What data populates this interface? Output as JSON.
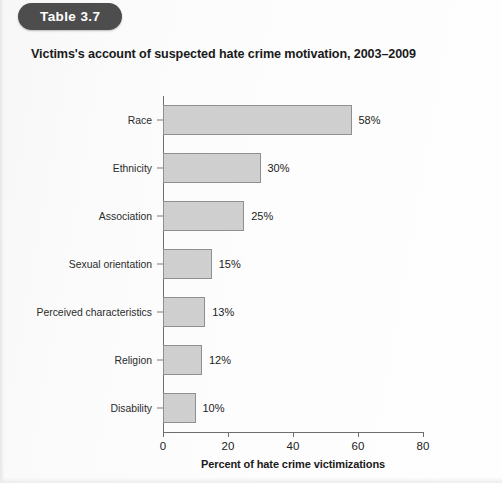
{
  "badge": {
    "label": "Table 3.7"
  },
  "title": "Victims's account of suspected hate crime motivation, 2003–2009",
  "chart_data": {
    "type": "bar",
    "orientation": "horizontal",
    "title": "Victims's account of suspected hate crime motivation, 2003–2009",
    "xlabel": "Percent of hate crime victimizations",
    "ylabel": "",
    "xlim": [
      0,
      80
    ],
    "xticks": [
      0,
      20,
      40,
      60,
      80
    ],
    "xtick_labels": [
      "0",
      "20",
      "40",
      "60",
      "80"
    ],
    "grid": false,
    "legend": null,
    "bar_fill_color": "#cfcfcf",
    "bar_edge_color": "#8f8f8f",
    "categories": [
      "Race",
      "Ethnicity",
      "Association",
      "Sexual orientation",
      "Perceived characteristics",
      "Religion",
      "Disability"
    ],
    "values": [
      58,
      30,
      25,
      15,
      13,
      12,
      10
    ],
    "data_labels": [
      "58%",
      "30%",
      "25%",
      "15%",
      "13%",
      "12%",
      "10%"
    ]
  }
}
